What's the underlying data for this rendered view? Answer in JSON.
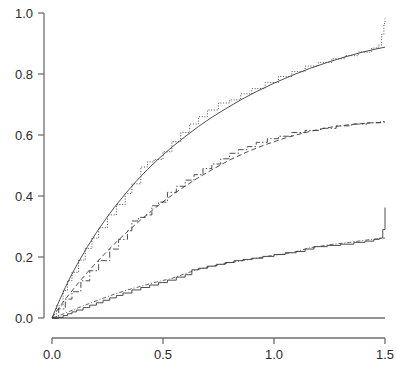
{
  "chart_data": {
    "type": "line",
    "title": "",
    "subtitle": "",
    "xlabel": "",
    "ylabel": "",
    "xlim": [
      0.0,
      1.5
    ],
    "ylim": [
      0.0,
      1.0
    ],
    "grid": false,
    "legend": "none",
    "xticks": [
      0.0,
      0.5,
      1.0,
      1.5
    ],
    "xtick_labels": [
      "0.0",
      "0.5",
      "1.0",
      "1.5"
    ],
    "yticks": [
      0.0,
      0.2,
      0.4,
      0.6,
      0.8,
      1.0
    ],
    "ytick_labels": [
      "0.0",
      "0.2",
      "0.4",
      "0.6",
      "0.8",
      "1.0"
    ],
    "axis_color": "#6e6e6e",
    "curve_color": "#3a3a3a",
    "series": [
      {
        "name": "upper-curve-smooth",
        "style": "solid-thin",
        "x": [
          0.0,
          0.02,
          0.04,
          0.06,
          0.08,
          0.1,
          0.13,
          0.16,
          0.2,
          0.24,
          0.28,
          0.33,
          0.38,
          0.43,
          0.48,
          0.54,
          0.6,
          0.66,
          0.72,
          0.78,
          0.85,
          0.92,
          1.0,
          1.08,
          1.16,
          1.24,
          1.32,
          1.4,
          1.46,
          1.5
        ],
        "y": [
          0.0,
          0.035,
          0.068,
          0.1,
          0.13,
          0.158,
          0.197,
          0.234,
          0.28,
          0.322,
          0.362,
          0.407,
          0.449,
          0.487,
          0.522,
          0.56,
          0.595,
          0.628,
          0.658,
          0.685,
          0.715,
          0.742,
          0.77,
          0.795,
          0.818,
          0.838,
          0.856,
          0.872,
          0.882,
          0.888
        ]
      },
      {
        "name": "upper-curve-step",
        "style": "dotted",
        "x": [
          0.0,
          0.02,
          0.05,
          0.07,
          0.09,
          0.12,
          0.15,
          0.18,
          0.21,
          0.25,
          0.29,
          0.33,
          0.36,
          0.4,
          0.43,
          0.46,
          0.5,
          0.54,
          0.58,
          0.62,
          0.66,
          0.7,
          0.75,
          0.8,
          0.85,
          0.9,
          0.96,
          1.02,
          1.08,
          1.14,
          1.2,
          1.26,
          1.32,
          1.38,
          1.44,
          1.47,
          1.485,
          1.495,
          1.5
        ],
        "y": [
          0.0,
          0.04,
          0.09,
          0.122,
          0.15,
          0.19,
          0.228,
          0.262,
          0.296,
          0.338,
          0.372,
          0.408,
          0.44,
          0.495,
          0.512,
          0.52,
          0.545,
          0.578,
          0.608,
          0.636,
          0.66,
          0.682,
          0.705,
          0.715,
          0.735,
          0.752,
          0.772,
          0.792,
          0.808,
          0.826,
          0.838,
          0.85,
          0.86,
          0.872,
          0.885,
          0.895,
          0.93,
          0.965,
          0.982
        ]
      },
      {
        "name": "middle-curve-smooth",
        "style": "dashed",
        "x": [
          0.0,
          0.02,
          0.05,
          0.08,
          0.12,
          0.16,
          0.2,
          0.25,
          0.3,
          0.35,
          0.4,
          0.46,
          0.52,
          0.58,
          0.65,
          0.72,
          0.8,
          0.88,
          0.96,
          1.05,
          1.14,
          1.24,
          1.34,
          1.44,
          1.5
        ],
        "y": [
          0.0,
          0.022,
          0.052,
          0.08,
          0.116,
          0.15,
          0.182,
          0.22,
          0.256,
          0.29,
          0.322,
          0.358,
          0.392,
          0.423,
          0.456,
          0.486,
          0.518,
          0.545,
          0.568,
          0.59,
          0.608,
          0.624,
          0.634,
          0.64,
          0.642
        ]
      },
      {
        "name": "middle-curve-step",
        "style": "dash-dot",
        "x": [
          0.0,
          0.03,
          0.06,
          0.09,
          0.13,
          0.17,
          0.21,
          0.26,
          0.3,
          0.34,
          0.36,
          0.39,
          0.42,
          0.45,
          0.48,
          0.52,
          0.56,
          0.6,
          0.64,
          0.68,
          0.72,
          0.76,
          0.8,
          0.84,
          0.88,
          0.92,
          0.97,
          1.02,
          1.08,
          1.14,
          1.21,
          1.28,
          1.35,
          1.42,
          1.48,
          1.5
        ],
        "y": [
          0.0,
          0.03,
          0.062,
          0.086,
          0.122,
          0.155,
          0.188,
          0.226,
          0.258,
          0.286,
          0.318,
          0.33,
          0.338,
          0.368,
          0.38,
          0.412,
          0.432,
          0.452,
          0.47,
          0.49,
          0.505,
          0.522,
          0.54,
          0.552,
          0.562,
          0.576,
          0.588,
          0.596,
          0.608,
          0.615,
          0.622,
          0.63,
          0.636,
          0.64,
          0.644,
          0.645
        ]
      },
      {
        "name": "lower-curve-step",
        "style": "solid-step",
        "x": [
          0.0,
          0.03,
          0.05,
          0.07,
          0.09,
          0.11,
          0.14,
          0.17,
          0.2,
          0.23,
          0.26,
          0.29,
          0.32,
          0.36,
          0.4,
          0.44,
          0.48,
          0.52,
          0.56,
          0.6,
          0.63,
          0.66,
          0.7,
          0.74,
          0.78,
          0.82,
          0.86,
          0.9,
          0.95,
          1.0,
          1.05,
          1.1,
          1.14,
          1.18,
          1.24,
          1.3,
          1.36,
          1.41,
          1.45,
          1.475,
          1.49,
          1.5
        ],
        "y": [
          0.0,
          0.002,
          0.008,
          0.014,
          0.02,
          0.026,
          0.034,
          0.042,
          0.05,
          0.058,
          0.066,
          0.074,
          0.082,
          0.092,
          0.1,
          0.108,
          0.116,
          0.124,
          0.134,
          0.142,
          0.158,
          0.163,
          0.17,
          0.176,
          0.182,
          0.188,
          0.192,
          0.196,
          0.202,
          0.208,
          0.214,
          0.218,
          0.226,
          0.234,
          0.238,
          0.242,
          0.248,
          0.252,
          0.258,
          0.262,
          0.29,
          0.362
        ]
      },
      {
        "name": "lower-curve-smooth",
        "style": "dash-dot-thin",
        "x": [
          0.0,
          0.04,
          0.08,
          0.12,
          0.17,
          0.22,
          0.28,
          0.34,
          0.4,
          0.47,
          0.54,
          0.61,
          0.68,
          0.76,
          0.84,
          0.92,
          1.0,
          1.08,
          1.16,
          1.25,
          1.34,
          1.42,
          1.5
        ],
        "y": [
          0.0,
          0.01,
          0.022,
          0.034,
          0.048,
          0.062,
          0.078,
          0.092,
          0.104,
          0.118,
          0.13,
          0.148,
          0.164,
          0.176,
          0.186,
          0.196,
          0.206,
          0.214,
          0.23,
          0.24,
          0.248,
          0.256,
          0.262
        ]
      }
    ]
  },
  "axes": {
    "x_axis_name": "x-axis",
    "y_axis_name": "y-axis"
  }
}
